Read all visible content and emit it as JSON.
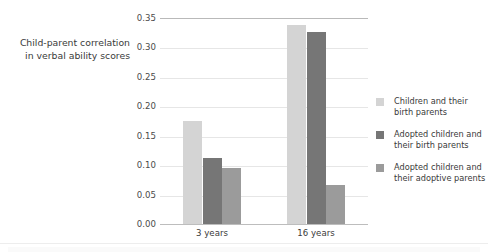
{
  "axis_title": {
    "line1": "Child-parent correlation",
    "line2": "in verbal ability scores"
  },
  "legend": {
    "items": [
      {
        "swatch_color": "#d4d4d4",
        "line1": "Children and their",
        "line2": "birth parents"
      },
      {
        "swatch_color": "#767676",
        "line1": "Adopted children and",
        "line2": "their birth parents"
      },
      {
        "swatch_color": "#9b9b9b",
        "line1": "Adopted children and",
        "line2": "their adoptive parents"
      }
    ]
  },
  "chart_data": {
    "type": "bar",
    "title": "",
    "subtitle": "",
    "xlabel": "",
    "ylabel": "Child-parent correlation in verbal ability scores",
    "categories": [
      "3 years",
      "16 years"
    ],
    "series": [
      {
        "name": "Children and their birth parents",
        "color": "#d4d4d4",
        "values": [
          0.175,
          0.338
        ]
      },
      {
        "name": "Adopted children and their birth parents",
        "color": "#767676",
        "values": [
          0.112,
          0.327
        ]
      },
      {
        "name": "Adopted children and their adoptive parents",
        "color": "#9b9b9b",
        "values": [
          0.096,
          0.067
        ]
      }
    ],
    "ylim": [
      0.0,
      0.35
    ],
    "ytick_values": [
      0.0,
      0.05,
      0.1,
      0.15,
      0.2,
      0.25,
      0.3,
      0.35
    ],
    "ytick_labels": [
      "0.00",
      "0.05",
      "0.10",
      "0.15",
      "0.20",
      "0.25",
      "0.30",
      "0.35"
    ],
    "grid": true,
    "grid_color": "#e6e6e6",
    "legend_position": "right",
    "background": "#ffffff"
  }
}
